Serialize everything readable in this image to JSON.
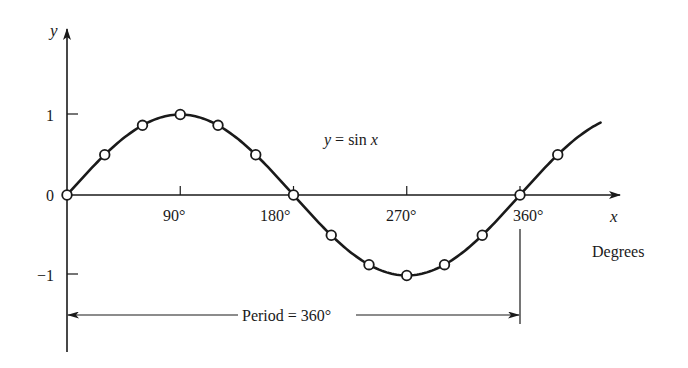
{
  "chart_data": {
    "type": "line",
    "title": "y = sin x",
    "function": "sin",
    "xlabel": "x",
    "xlabel_unit": "Degrees",
    "ylabel": "y",
    "x_ticks": [
      {
        "value": 90,
        "label": "90°"
      },
      {
        "value": 180,
        "label": "180°"
      },
      {
        "value": 270,
        "label": "270°"
      },
      {
        "value": 360,
        "label": "360°"
      }
    ],
    "y_ticks": [
      {
        "value": 1,
        "label": "1"
      },
      {
        "value": 0,
        "label": "0"
      },
      {
        "value": -1,
        "label": "-1"
      }
    ],
    "xlim": [
      0,
      425
    ],
    "ylim": [
      -1,
      1
    ],
    "markers_x": [
      0,
      30,
      60,
      90,
      120,
      150,
      180,
      210,
      240,
      270,
      300,
      330,
      360,
      390
    ],
    "markers_y": [
      0,
      0.5,
      0.866,
      1,
      0.866,
      0.5,
      0,
      -0.5,
      -0.866,
      -1,
      -0.866,
      -0.5,
      0,
      0.5
    ],
    "annotation": "Period = 360°",
    "grid": false,
    "colors": {
      "ink": "#1a1a1a",
      "marker_fill": "#ffffff"
    }
  },
  "labels": {
    "equation": "y = sin x",
    "y_axis": "y",
    "x_axis": "x",
    "units": "Degrees",
    "period": "Period = 360°",
    "tick_90": "90°",
    "tick_180": "180°",
    "tick_270": "270°",
    "tick_360": "360°",
    "tick_y1": "1",
    "tick_y0": "0",
    "tick_ym1": "−1"
  }
}
